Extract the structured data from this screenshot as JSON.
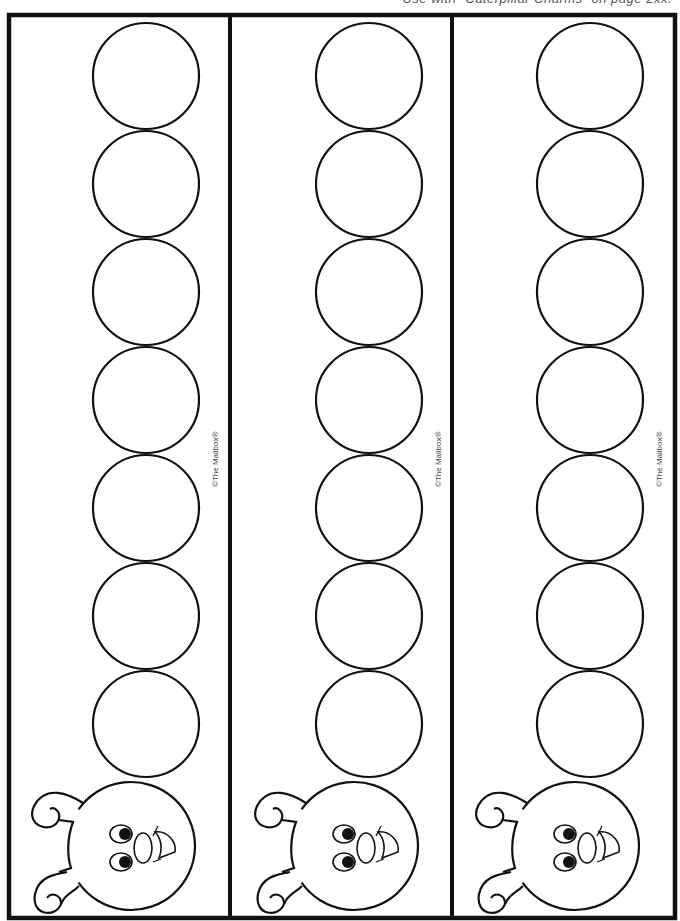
{
  "page": {
    "top_note": "Use with “Caterpillar Charms” on page 2xx."
  },
  "colors": {
    "ink": "#111111",
    "paper": "#ffffff",
    "copyright": "#444444"
  },
  "strips": [
    {
      "label": "strip-1",
      "offset_x": 0,
      "copyright": "©The Mailbox®"
    },
    {
      "label": "strip-2",
      "offset_x": 223,
      "copyright": "©The Mailbox®"
    },
    {
      "label": "strip-3",
      "offset_x": 444,
      "copyright": "©The Mailbox®"
    }
  ],
  "body_segments": {
    "count": 7,
    "center_x": 146,
    "center_y_start": 76,
    "spacing": 108,
    "radius": 53
  },
  "head": {
    "center_x": 131,
    "center_y": 846,
    "radius": 64
  }
}
